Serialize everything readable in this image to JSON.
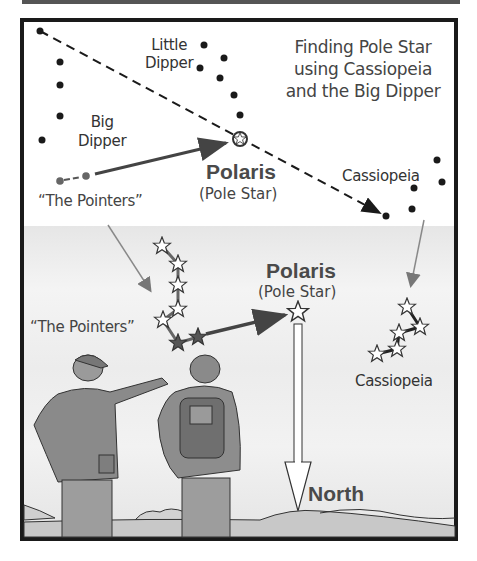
{
  "diagram": {
    "title": [
      "Finding Pole Star",
      "using Cassiopeia",
      "and the Big Dipper"
    ],
    "upper_labels": {
      "little_dipper": [
        "Little",
        "Dipper"
      ],
      "big_dipper": [
        "Big",
        "Dipper"
      ],
      "pointers": "“The Pointers”",
      "polaris": "Polaris",
      "pole_star": "(Pole Star)",
      "cassiopeia": "Cassiopeia"
    },
    "lower_labels": {
      "pointers": "“The Pointers”",
      "polaris": "Polaris",
      "pole_star": "(Pole Star)",
      "cassiopeia": "Cassiopeia",
      "north": "North"
    },
    "colors": {
      "border": "#1a1a1a",
      "dot": "#1a1a1a",
      "pointer_dot": "#666666",
      "arrow_gray": "#777777",
      "arrow_dark": "#444444",
      "sky": "#eeeeee",
      "text": "#333333"
    },
    "upper_stars": {
      "big_dipper": [
        [
          40,
          31
        ],
        [
          60,
          62
        ],
        [
          60,
          85
        ],
        [
          60,
          116
        ],
        [
          42,
          140
        ]
      ],
      "pointers": [
        [
          60,
          181
        ],
        [
          86,
          176
        ]
      ],
      "little_dipper": [
        [
          204,
          45
        ],
        [
          224,
          58
        ],
        [
          200,
          68
        ],
        [
          220,
          78
        ],
        [
          234,
          95
        ],
        [
          240,
          115
        ]
      ],
      "polaris": [
        240,
        139
      ],
      "cassiopeia": [
        [
          437,
          160
        ],
        [
          442,
          182
        ],
        [
          414,
          188
        ],
        [
          412,
          209
        ],
        [
          386,
          216
        ]
      ]
    },
    "lower_stars": {
      "big_dipper": [
        [
          162,
          246
        ],
        [
          178,
          264
        ],
        [
          178,
          285
        ],
        [
          178,
          309
        ],
        [
          163,
          320
        ],
        [
          178,
          343
        ],
        [
          198,
          337
        ]
      ],
      "polaris": [
        298,
        312
      ],
      "cassiopeia": [
        [
          407,
          307
        ],
        [
          420,
          327
        ],
        [
          399,
          333
        ],
        [
          397,
          349
        ],
        [
          377,
          354
        ]
      ]
    }
  }
}
